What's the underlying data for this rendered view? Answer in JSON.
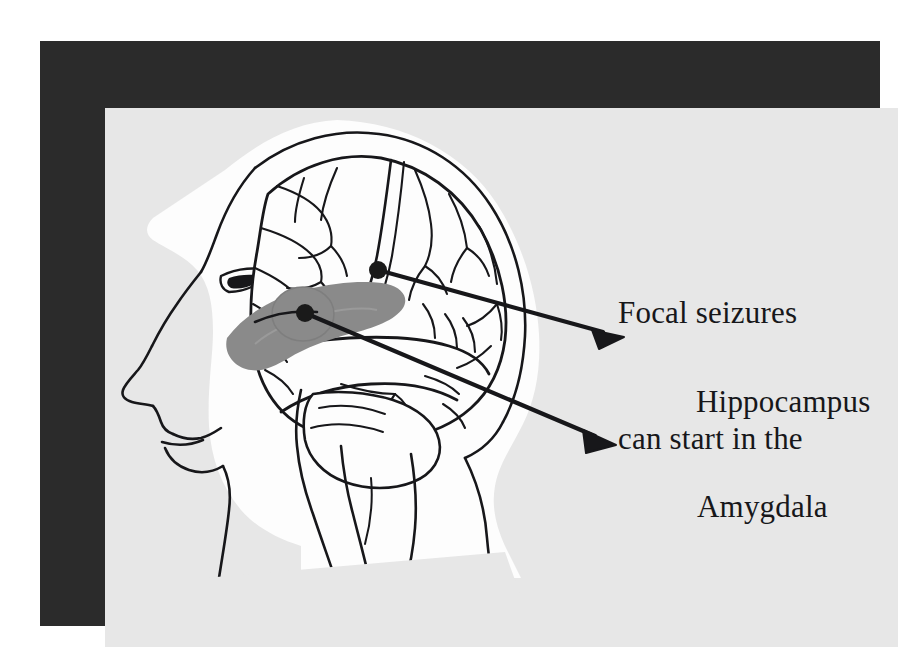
{
  "figure": {
    "kind": "anatomical-illustration",
    "colors": {
      "page_background": "#ffffff",
      "frame_border": "#2b2b2b",
      "panel_background": "#e7e7e7",
      "head_fill": "#fdfdfd",
      "ink": "#17171a",
      "structure_gray": "#8a8a8a",
      "structure_gray_dark": "#6f6f6f",
      "marker_dot": "#1a1a1a"
    }
  },
  "caption": {
    "line1": "Focal seizures",
    "line2": "can start in the"
  },
  "callouts": [
    {
      "id": "hippocampus",
      "label": "Hippocampus",
      "marker_dot": {
        "x": 273,
        "y": 162
      },
      "arrow_tip": {
        "x": 515,
        "y": 228
      }
    },
    {
      "id": "amygdala",
      "label": "Amygdala",
      "marker_dot": {
        "x": 200,
        "y": 205
      },
      "arrow_tip": {
        "x": 507,
        "y": 333
      }
    }
  ],
  "anatomy_parts": [
    "skull-outline",
    "brain-cortex",
    "cerebral-sulci",
    "central-sulcus",
    "temporal-lobe",
    "cerebellum",
    "brainstem",
    "spinal-cord",
    "face-profile",
    "eye",
    "nose",
    "lips",
    "chin",
    "neck"
  ]
}
